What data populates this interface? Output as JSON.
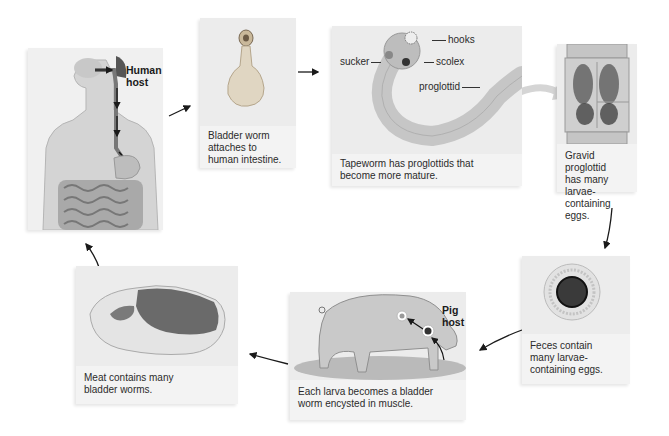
{
  "diagram": {
    "panels": [
      {
        "id": "human-host",
        "label": "Human host",
        "caption": ""
      },
      {
        "id": "bladder-worm-attaches",
        "caption": "Bladder worm attaches to human intestine."
      },
      {
        "id": "tapeworm",
        "caption": "Tapeworm has proglottids that become more mature.",
        "callouts": [
          "hooks",
          "sucker",
          "scolex",
          "proglottid"
        ]
      },
      {
        "id": "gravid-proglottid",
        "caption": "Gravid proglottid has many larvae-containing eggs."
      },
      {
        "id": "feces-eggs",
        "caption": "Feces contain many larvae-containing eggs."
      },
      {
        "id": "pig-host",
        "label": "Pig host",
        "caption": "Each larva becomes a bladder worm encysted in muscle."
      },
      {
        "id": "meat",
        "caption": "Meat contains many bladder worms."
      }
    ],
    "flow": [
      "human-host",
      "bladder-worm-attaches",
      "tapeworm",
      "gravid-proglottid",
      "feces-eggs",
      "pig-host",
      "meat",
      "human-host"
    ]
  },
  "text": {
    "human_label_1": "Human",
    "human_label_2": "host",
    "bladder_cap_1": "Bladder worm",
    "bladder_cap_2": "attaches to",
    "bladder_cap_3": "human intestine.",
    "tape_cap_1": "Tapeworm has proglottids that",
    "tape_cap_2": "become more mature.",
    "hooks": "hooks",
    "sucker": "sucker",
    "scolex": "scolex",
    "proglottid": "proglottid",
    "gravid_cap_1": "Gravid proglottid",
    "gravid_cap_2": "has many larvae-",
    "gravid_cap_3": "containing eggs.",
    "feces_cap_1": "Feces contain",
    "feces_cap_2": "many larvae-",
    "feces_cap_3": "containing eggs.",
    "pig_label_1": "Pig",
    "pig_label_2": "host",
    "pig_cap_1": "Each larva becomes a bladder",
    "pig_cap_2": "worm encysted in muscle.",
    "meat_cap_1": "Meat contains many",
    "meat_cap_2": "bladder worms."
  }
}
